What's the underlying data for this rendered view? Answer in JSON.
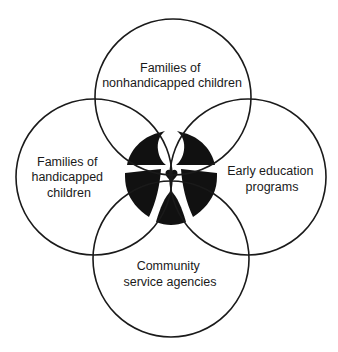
{
  "diagram": {
    "type": "four-circle overlapping (Venn-style) diagram",
    "colors": {
      "stroke": "#1a1a1a",
      "fill_center": "#111111",
      "background": "#ffffff"
    },
    "circles": [
      {
        "id": "top",
        "label_lines": [
          "Families of",
          "nonhandicapped children"
        ]
      },
      {
        "id": "left",
        "label_lines": [
          "Families of",
          "handicapped",
          "children"
        ]
      },
      {
        "id": "right",
        "label_lines": [
          "Early education",
          "programs"
        ]
      },
      {
        "id": "bottom",
        "label_lines": [
          "Community",
          "service agencies"
        ]
      }
    ],
    "center_emblem": {
      "description": "black intersection area with white cut-out human figure and a heart",
      "icon": "human-figure-with-heart-icon"
    }
  }
}
